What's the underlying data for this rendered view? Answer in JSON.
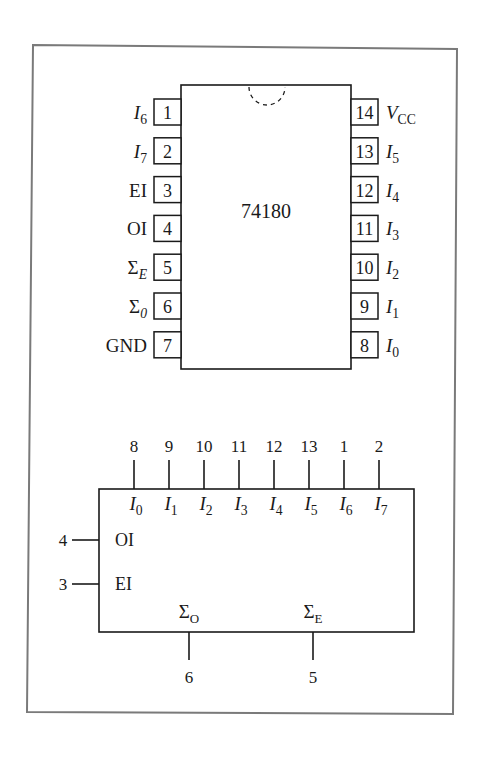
{
  "frame": {
    "stroke": "#7a7a7a"
  },
  "package": {
    "part_number": "74180",
    "left_pins": [
      {
        "num": "1",
        "name": "I",
        "sub": "6",
        "italic": true
      },
      {
        "num": "2",
        "name": "I",
        "sub": "7",
        "italic": true
      },
      {
        "num": "3",
        "name": "EI",
        "sub": "",
        "italic": false
      },
      {
        "num": "4",
        "name": "OI",
        "sub": "",
        "italic": false
      },
      {
        "num": "5",
        "name": "Σ",
        "sub": "E",
        "italic": false
      },
      {
        "num": "6",
        "name": "Σ",
        "sub": "0",
        "italic": false
      },
      {
        "num": "7",
        "name": "GND",
        "sub": "",
        "italic": false
      }
    ],
    "right_pins": [
      {
        "num": "14",
        "name": "V",
        "sub": "CC",
        "italic": true
      },
      {
        "num": "13",
        "name": "I",
        "sub": "5",
        "italic": true
      },
      {
        "num": "12",
        "name": "I",
        "sub": "4",
        "italic": true
      },
      {
        "num": "11",
        "name": "I",
        "sub": "3",
        "italic": true
      },
      {
        "num": "10",
        "name": "I",
        "sub": "2",
        "italic": true
      },
      {
        "num": "9",
        "name": "I",
        "sub": "1",
        "italic": true
      },
      {
        "num": "8",
        "name": "I",
        "sub": "0",
        "italic": true
      }
    ]
  },
  "logic_symbol": {
    "top_inputs": [
      {
        "pin": "8",
        "name": "I",
        "sub": "0"
      },
      {
        "pin": "9",
        "name": "I",
        "sub": "1"
      },
      {
        "pin": "10",
        "name": "I",
        "sub": "2"
      },
      {
        "pin": "11",
        "name": "I",
        "sub": "3"
      },
      {
        "pin": "12",
        "name": "I",
        "sub": "4"
      },
      {
        "pin": "13",
        "name": "I",
        "sub": "5"
      },
      {
        "pin": "1",
        "name": "I",
        "sub": "6"
      },
      {
        "pin": "2",
        "name": "I",
        "sub": "7"
      }
    ],
    "left_inputs": [
      {
        "pin": "4",
        "name": "OI"
      },
      {
        "pin": "3",
        "name": "EI"
      }
    ],
    "outputs": [
      {
        "pin": "6",
        "name": "Σ",
        "sub": "O"
      },
      {
        "pin": "5",
        "name": "Σ",
        "sub": "E"
      }
    ]
  }
}
